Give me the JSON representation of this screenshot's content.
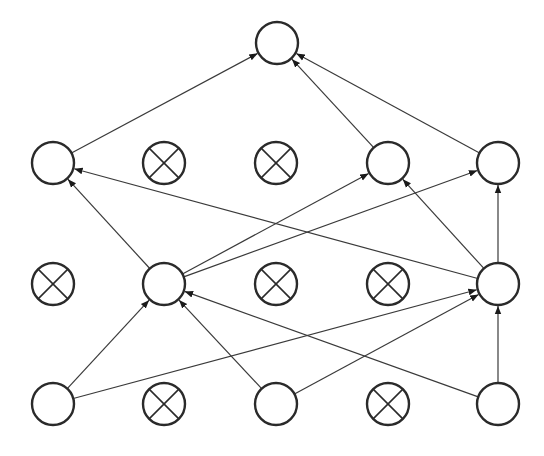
{
  "diagram": {
    "type": "neural-network-dropout",
    "background": "#ffffff",
    "stroke_color": "#2a2a2a",
    "node_radius": 21,
    "columns_x": [
      53,
      164,
      276,
      388,
      498
    ],
    "layers": [
      {
        "name": "input",
        "y": 404,
        "nodes": [
          {
            "id": "i0",
            "col": 0,
            "dropped": false
          },
          {
            "id": "i1",
            "col": 1,
            "dropped": true
          },
          {
            "id": "i2",
            "col": 2,
            "dropped": false
          },
          {
            "id": "i3",
            "col": 3,
            "dropped": true
          },
          {
            "id": "i4",
            "col": 4,
            "dropped": false
          }
        ]
      },
      {
        "name": "hidden-1",
        "y": 284,
        "nodes": [
          {
            "id": "h1_0",
            "col": 0,
            "dropped": true
          },
          {
            "id": "h1_1",
            "col": 1,
            "dropped": false
          },
          {
            "id": "h1_2",
            "col": 2,
            "dropped": true
          },
          {
            "id": "h1_3",
            "col": 3,
            "dropped": true
          },
          {
            "id": "h1_4",
            "col": 4,
            "dropped": false
          }
        ]
      },
      {
        "name": "hidden-2",
        "y": 163,
        "nodes": [
          {
            "id": "h2_0",
            "col": 0,
            "dropped": false
          },
          {
            "id": "h2_1",
            "col": 1,
            "dropped": true
          },
          {
            "id": "h2_2",
            "col": 2,
            "dropped": true
          },
          {
            "id": "h2_3",
            "col": 3,
            "dropped": false
          },
          {
            "id": "h2_4",
            "col": 4,
            "dropped": false
          }
        ]
      },
      {
        "name": "output",
        "y": 43,
        "nodes": [
          {
            "id": "o0",
            "x": 277,
            "dropped": false
          }
        ]
      }
    ],
    "edges": [
      [
        "i0",
        "h1_1"
      ],
      [
        "i0",
        "h1_4"
      ],
      [
        "i2",
        "h1_1"
      ],
      [
        "i2",
        "h1_4"
      ],
      [
        "i4",
        "h1_1"
      ],
      [
        "i4",
        "h1_4"
      ],
      [
        "h1_1",
        "h2_0"
      ],
      [
        "h1_1",
        "h2_3"
      ],
      [
        "h1_1",
        "h2_4"
      ],
      [
        "h1_4",
        "h2_0"
      ],
      [
        "h1_4",
        "h2_3"
      ],
      [
        "h1_4",
        "h2_4"
      ],
      [
        "h2_0",
        "o0"
      ],
      [
        "h2_3",
        "o0"
      ],
      [
        "h2_4",
        "o0"
      ]
    ]
  }
}
